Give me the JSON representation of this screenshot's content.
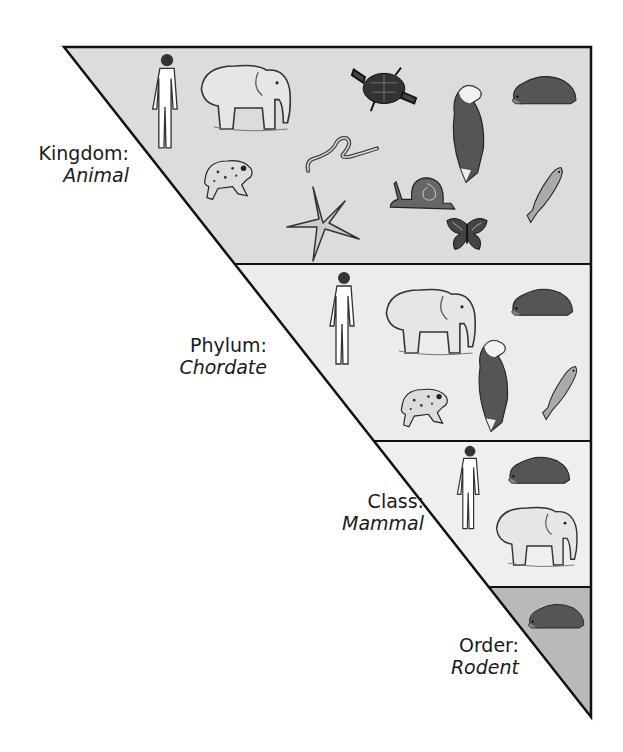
{
  "diagram": {
    "colors": {
      "kingdom_fill": "#dcdcdc",
      "phylum_fill": "#ececec",
      "class_fill": "#eeeeee",
      "order_fill": "#b9b9b9",
      "stroke": "#111111"
    },
    "levels": [
      {
        "rank": "Kingdom:",
        "taxon": "Animal",
        "organisms": [
          "human",
          "elephant",
          "turtle",
          "worm",
          "eagle",
          "hedgehog",
          "frog",
          "starfish",
          "snail",
          "fish",
          "butterfly"
        ]
      },
      {
        "rank": "Phylum:",
        "taxon": "Chordate",
        "organisms": [
          "human",
          "elephant",
          "hedgehog",
          "eagle",
          "frog",
          "fish"
        ]
      },
      {
        "rank": "Class:",
        "taxon": "Mammal",
        "organisms": [
          "human",
          "hedgehog",
          "elephant"
        ]
      },
      {
        "rank": "Order:",
        "taxon": "Rodent",
        "organisms": [
          "hedgehog"
        ]
      }
    ]
  }
}
